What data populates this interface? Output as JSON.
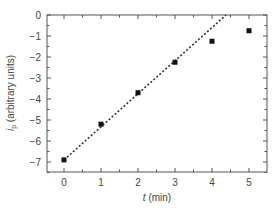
{
  "chart_data": {
    "type": "scatter",
    "title": "",
    "xlabel": "t (min)",
    "xlabel_italic_part": "t",
    "xlabel_rest": " (min)",
    "ylabel": "i_p (arbitrary units)",
    "ylabel_main": "i",
    "ylabel_sub": "p",
    "ylabel_rest": " (arbitrary units)",
    "xlim": [
      -0.5,
      5.3
    ],
    "ylim": [
      -7.5,
      0
    ],
    "xticks": [
      0,
      1,
      2,
      3,
      4,
      5
    ],
    "yticks": [
      0,
      -1,
      -2,
      -3,
      -4,
      -5,
      -6,
      -7
    ],
    "xtick_labels": [
      "0",
      "1",
      "2",
      "3",
      "4",
      "5"
    ],
    "ytick_labels": [
      "0",
      "−1",
      "−2",
      "−3",
      "−4",
      "−5",
      "−6",
      "−7"
    ],
    "grid": false,
    "legend": null,
    "series": [
      {
        "name": "data",
        "marker": "square",
        "color": "#111111",
        "x": [
          0,
          1,
          2,
          3,
          4,
          5
        ],
        "y": [
          -6.9,
          -5.2,
          -3.7,
          -2.25,
          -1.25,
          -0.75
        ]
      },
      {
        "name": "linear fit",
        "style": "dotted-line",
        "color": "#333333",
        "x": [
          0,
          4.38
        ],
        "y": [
          -6.9,
          0
        ]
      }
    ]
  }
}
